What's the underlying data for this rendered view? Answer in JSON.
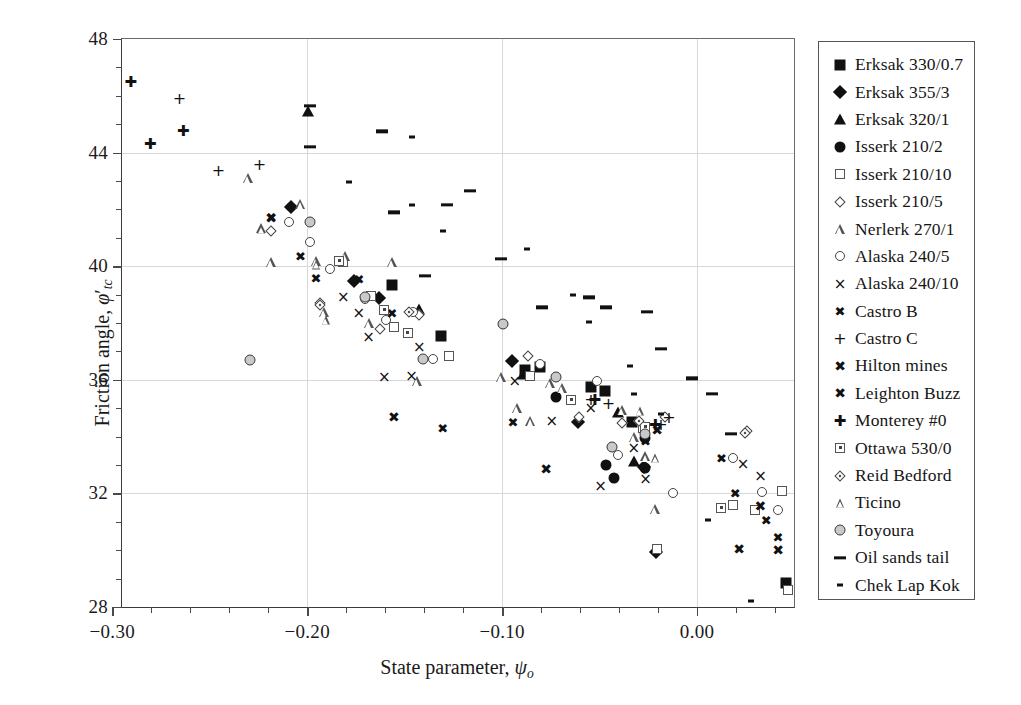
{
  "chart_data": {
    "type": "scatter",
    "title": "",
    "xlabel": "State parameter, ψo",
    "ylabel": "Friction angle, φ'tc",
    "xlim": [
      -0.295,
      0.0497
    ],
    "ylim": [
      28,
      48
    ],
    "xticks": [
      -0.3,
      -0.2,
      -0.1,
      0.0
    ],
    "xticklabels": [
      "−0.30",
      "−0.20",
      "−0.10",
      "0.00"
    ],
    "xminor_step": 0.02,
    "yticks": [
      28,
      32,
      36,
      40,
      44,
      48
    ],
    "yticklabels": [
      "28",
      "32",
      "36",
      "40",
      "44",
      "48"
    ],
    "yminor_step": 1,
    "grid": "both-major-light",
    "legend_position": "outside-right",
    "series": [
      {
        "name": "Erksak 330/0.7",
        "marker": "filled-square",
        "points": [
          [
            -0.1565,
            39.35
          ],
          [
            -0.1315,
            37.55
          ],
          [
            -0.0885,
            36.35
          ],
          [
            -0.0805,
            36.45
          ],
          [
            -0.0545,
            35.75
          ],
          [
            -0.0475,
            35.6
          ],
          [
            -0.0335,
            34.5
          ],
          [
            0.0455,
            28.85
          ]
        ]
      },
      {
        "name": "Erksak 355/3",
        "marker": "filled-diamond",
        "points": [
          [
            -0.2055,
            41.9
          ],
          [
            -0.1735,
            39.3
          ],
          [
            -0.1605,
            38.7
          ],
          [
            -0.0925,
            36.5
          ],
          [
            -0.0585,
            34.35
          ],
          [
            -0.0245,
            32.75
          ],
          [
            -0.0185,
            29.75
          ]
        ]
      },
      {
        "name": "Erksak 320/1",
        "marker": "filled-triangle",
        "points": [
          [
            -0.1995,
            45.45
          ],
          [
            -0.1425,
            38.5
          ],
          [
            -0.0895,
            36.2
          ],
          [
            -0.0405,
            34.85
          ],
          [
            -0.0325,
            33.15
          ]
        ]
      },
      {
        "name": "Isserk 210/2",
        "marker": "filled-circle",
        "points": [
          [
            -0.0725,
            35.4
          ],
          [
            -0.0465,
            33.0
          ],
          [
            -0.0425,
            32.55
          ],
          [
            -0.0265,
            33.95
          ],
          [
            -0.0265,
            32.9
          ]
        ]
      },
      {
        "name": "Isserk 210/10",
        "marker": "open-square",
        "points": [
          [
            -0.1815,
            40.15
          ],
          [
            -0.1675,
            38.95
          ],
          [
            -0.1555,
            37.85
          ],
          [
            -0.1275,
            36.85
          ],
          [
            -0.0855,
            36.15
          ],
          [
            -0.0275,
            34.3
          ],
          [
            -0.0205,
            30.05
          ],
          [
            0.0185,
            31.6
          ],
          [
            0.0295,
            31.4
          ],
          [
            0.0435,
            32.1
          ],
          [
            0.0465,
            28.6
          ]
        ]
      },
      {
        "name": "Isserk 210/5",
        "marker": "open-diamond",
        "points": [
          [
            -0.2165,
            41.1
          ],
          [
            -0.1915,
            38.55
          ],
          [
            -0.1605,
            37.65
          ],
          [
            -0.1405,
            38.15
          ],
          [
            -0.0845,
            36.7
          ],
          [
            -0.0585,
            34.55
          ],
          [
            -0.0365,
            34.35
          ],
          [
            -0.0145,
            34.55
          ],
          [
            0.0275,
            34.05
          ]
        ]
      },
      {
        "name": "Nerlerk 270/1",
        "marker": "open-triangle",
        "points": [
          [
            -0.2305,
            43.1
          ],
          [
            -0.2235,
            41.35
          ],
          [
            -0.2185,
            40.15
          ],
          [
            -0.2035,
            42.2
          ],
          [
            -0.1955,
            40.2
          ],
          [
            -0.1915,
            38.4
          ],
          [
            -0.1805,
            40.35
          ],
          [
            -0.1685,
            38.0
          ],
          [
            -0.1565,
            40.15
          ],
          [
            -0.1435,
            35.95
          ],
          [
            -0.1005,
            36.1
          ],
          [
            -0.0925,
            35.0
          ],
          [
            -0.0855,
            34.55
          ],
          [
            -0.0755,
            35.9
          ],
          [
            -0.0695,
            35.7
          ],
          [
            -0.0385,
            34.95
          ],
          [
            -0.0325,
            34.0
          ],
          [
            -0.0265,
            33.3
          ],
          [
            -0.0215,
            31.45
          ]
        ]
      },
      {
        "name": "Alaska 240/5",
        "marker": "open-circle",
        "points": [
          [
            -0.2095,
            41.55
          ],
          [
            -0.1985,
            40.85
          ],
          [
            -0.1885,
            39.9
          ],
          [
            -0.1705,
            38.85
          ],
          [
            -0.1595,
            38.1
          ],
          [
            -0.1455,
            38.4
          ],
          [
            -0.1355,
            36.75
          ],
          [
            -0.0995,
            37.95
          ],
          [
            -0.0805,
            36.55
          ],
          [
            -0.0725,
            36.1
          ],
          [
            -0.0515,
            35.95
          ],
          [
            -0.0435,
            33.65
          ],
          [
            -0.0405,
            33.35
          ],
          [
            -0.0265,
            34.1
          ],
          [
            -0.0125,
            32.0
          ],
          [
            0.0185,
            33.25
          ],
          [
            0.0335,
            32.05
          ],
          [
            0.0415,
            31.4
          ]
        ]
      },
      {
        "name": "Alaska 240/10",
        "marker": "x-thin",
        "points": [
          [
            -0.1815,
            38.9
          ],
          [
            -0.1735,
            38.35
          ],
          [
            -0.1685,
            37.5
          ],
          [
            -0.1605,
            36.1
          ],
          [
            -0.1465,
            36.15
          ],
          [
            -0.1425,
            37.15
          ],
          [
            -0.0935,
            35.95
          ],
          [
            -0.0745,
            34.55
          ],
          [
            -0.0545,
            35.0
          ],
          [
            -0.0495,
            32.25
          ],
          [
            -0.0325,
            33.6
          ],
          [
            -0.0265,
            32.5
          ],
          [
            0.0235,
            33.05
          ],
          [
            0.0325,
            32.6
          ]
        ]
      },
      {
        "name": "Castro B",
        "marker": "x-bold",
        "points": [
          [
            -0.2185,
            41.75
          ],
          [
            -0.2035,
            40.35
          ],
          [
            -0.1955,
            39.6
          ],
          [
            -0.1735,
            39.55
          ],
          [
            -0.1565,
            38.35
          ],
          [
            -0.1305,
            34.3
          ],
          [
            -0.0945,
            34.5
          ],
          [
            -0.0265,
            33.85
          ],
          [
            0.0125,
            33.25
          ],
          [
            0.0195,
            32.0
          ],
          [
            0.0355,
            31.05
          ],
          [
            0.0415,
            30.45
          ]
        ]
      },
      {
        "name": "Castro C",
        "marker": "plus",
        "points": [
          [
            -0.2655,
            45.9
          ],
          [
            -0.2455,
            43.35
          ],
          [
            -0.2245,
            43.55
          ],
          [
            -0.0545,
            35.3
          ],
          [
            -0.0455,
            35.15
          ],
          [
            -0.0185,
            34.4
          ],
          [
            -0.0145,
            34.65
          ]
        ]
      },
      {
        "name": "Hilton mines",
        "marker": "x-heavy",
        "points": [
          [
            -0.2185,
            41.7
          ],
          [
            -0.1555,
            34.7
          ],
          [
            -0.0775,
            32.85
          ]
        ]
      },
      {
        "name": "Leighton Buzz",
        "marker": "x-star",
        "points": [
          [
            -0.0205,
            34.25
          ],
          [
            0.0215,
            30.05
          ],
          [
            0.0325,
            31.55
          ],
          [
            0.0415,
            30.0
          ]
        ]
      },
      {
        "name": "Monterey #0",
        "marker": "plus-bold",
        "points": [
          [
            -0.2905,
            46.5
          ],
          [
            -0.2805,
            44.3
          ],
          [
            -0.2635,
            44.75
          ],
          [
            -0.0525,
            35.3
          ],
          [
            -0.0215,
            34.4
          ]
        ]
      },
      {
        "name": "Ottawa 530/0",
        "marker": "open-square-dot",
        "points": [
          [
            -0.1835,
            40.2
          ],
          [
            -0.1605,
            38.45
          ],
          [
            -0.1485,
            37.65
          ],
          [
            -0.0645,
            35.3
          ],
          [
            -0.0265,
            34.35
          ],
          [
            0.0125,
            31.5
          ]
        ]
      },
      {
        "name": "Reid Bedford",
        "marker": "open-diamond-dot",
        "points": [
          [
            -0.1915,
            38.5
          ],
          [
            -0.1455,
            38.25
          ],
          [
            -0.0275,
            34.4
          ],
          [
            0.0265,
            34.0
          ]
        ]
      },
      {
        "name": "Ticino",
        "marker": "open-triangle-sm",
        "points": [
          [
            -0.2235,
            41.3
          ],
          [
            -0.1955,
            40.05
          ],
          [
            -0.1905,
            38.1
          ],
          [
            -0.0295,
            34.9
          ],
          [
            -0.0215,
            33.25
          ]
        ]
      },
      {
        "name": "Toyoura",
        "marker": "open-circle-gray",
        "points": [
          [
            -0.2295,
            36.7
          ],
          [
            -0.1985,
            41.55
          ],
          [
            -0.1705,
            38.9
          ],
          [
            -0.1405,
            36.75
          ],
          [
            -0.0995,
            37.95
          ],
          [
            -0.0725,
            36.1
          ],
          [
            -0.0435,
            33.65
          ],
          [
            -0.0265,
            34.1
          ]
        ]
      },
      {
        "name": "Oil sands tail",
        "marker": "dash-long",
        "points": [
          [
            -0.1985,
            45.65
          ],
          [
            -0.1985,
            44.2
          ],
          [
            -0.1615,
            44.75
          ],
          [
            -0.1555,
            41.9
          ],
          [
            -0.1395,
            39.65
          ],
          [
            -0.1285,
            42.15
          ],
          [
            -0.1165,
            42.65
          ],
          [
            -0.1005,
            40.25
          ],
          [
            -0.0795,
            38.55
          ],
          [
            -0.0555,
            38.9
          ],
          [
            -0.0465,
            38.55
          ],
          [
            -0.0255,
            38.4
          ],
          [
            -0.0185,
            37.1
          ],
          [
            -0.0025,
            36.05
          ],
          [
            0.0075,
            35.5
          ],
          [
            0.0175,
            34.1
          ]
        ]
      },
      {
        "name": "Chek Lap Kok",
        "marker": "dash-short",
        "points": [
          [
            -0.1465,
            44.55
          ],
          [
            -0.1465,
            42.15
          ],
          [
            -0.1305,
            41.25
          ],
          [
            -0.1785,
            42.95
          ],
          [
            -0.0875,
            40.6
          ],
          [
            -0.0635,
            39.0
          ],
          [
            -0.0555,
            38.05
          ],
          [
            -0.0345,
            36.5
          ],
          [
            -0.0325,
            35.5
          ],
          [
            -0.0185,
            34.8
          ],
          [
            0.0055,
            31.05
          ],
          [
            0.0275,
            28.2
          ]
        ]
      }
    ]
  },
  "legend": {
    "items": [
      {
        "label": "Erksak 330/0.7",
        "marker": "filled-square"
      },
      {
        "label": "Erksak 355/3",
        "marker": "filled-diamond"
      },
      {
        "label": "Erksak 320/1",
        "marker": "filled-triangle"
      },
      {
        "label": "Isserk 210/2",
        "marker": "filled-circle"
      },
      {
        "label": "Isserk 210/10",
        "marker": "open-square"
      },
      {
        "label": "Isserk 210/5",
        "marker": "open-diamond"
      },
      {
        "label": "Nerlerk 270/1",
        "marker": "open-triangle"
      },
      {
        "label": "Alaska 240/5",
        "marker": "open-circle"
      },
      {
        "label": "Alaska 240/10",
        "marker": "x-thin"
      },
      {
        "label": "Castro B",
        "marker": "x-bold"
      },
      {
        "label": "Castro C",
        "marker": "plus"
      },
      {
        "label": "Hilton mines",
        "marker": "x-heavy"
      },
      {
        "label": "Leighton Buzz",
        "marker": "x-star"
      },
      {
        "label": "Monterey #0",
        "marker": "plus-bold"
      },
      {
        "label": "Ottawa 530/0",
        "marker": "open-square-dot"
      },
      {
        "label": "Reid Bedford",
        "marker": "open-diamond-dot"
      },
      {
        "label": "Ticino",
        "marker": "open-triangle-sm"
      },
      {
        "label": "Toyoura",
        "marker": "open-circle-gray"
      },
      {
        "label": "Oil sands tail",
        "marker": "dash-long"
      },
      {
        "label": "Chek Lap Kok",
        "marker": "dash-short"
      }
    ]
  },
  "colors": {
    "marker": "#111111",
    "axis": "#3a3a3a",
    "grid": "#d8d8d8",
    "background": "#ffffff"
  }
}
